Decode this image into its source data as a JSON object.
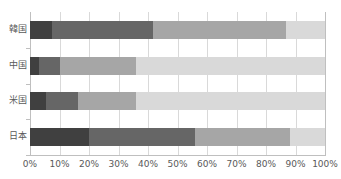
{
  "chart_data": {
    "type": "bar",
    "subtype": "stacked-horizontal-100pct",
    "title": "",
    "xlabel": "",
    "ylabel": "",
    "orientation": "horizontal",
    "stacked": true,
    "normalized_percent": true,
    "grid": true,
    "legend_position": "none",
    "xlim": [
      0,
      100
    ],
    "xticks": [
      0,
      10,
      20,
      30,
      40,
      50,
      60,
      70,
      80,
      90,
      100
    ],
    "xtick_labels": [
      "0%",
      "10%",
      "20%",
      "30%",
      "40%",
      "50%",
      "60%",
      "70%",
      "80%",
      "90%",
      "100%"
    ],
    "categories": [
      "韓国",
      "中国",
      "米国",
      "日本"
    ],
    "series": [
      {
        "name": "segment-1",
        "color": "#404040",
        "values": [
          7.5,
          3.0,
          5.4,
          20.0
        ]
      },
      {
        "name": "segment-2",
        "color": "#666666",
        "values": [
          34.2,
          7.3,
          10.9,
          36.0
        ]
      },
      {
        "name": "segment-3",
        "color": "#a6a6a6",
        "values": [
          45.1,
          25.6,
          19.7,
          32.0
        ]
      },
      {
        "name": "segment-4",
        "color": "#d9d9d9",
        "values": [
          13.2,
          64.1,
          64.0,
          12.0
        ]
      }
    ],
    "cumulative_boundaries": {
      "韓国": [
        7.5,
        41.7,
        86.8,
        100
      ],
      "中国": [
        3.0,
        10.3,
        35.9,
        100
      ],
      "米国": [
        5.4,
        16.3,
        36.0,
        100
      ],
      "日本": [
        20.0,
        56.0,
        88.0,
        100
      ]
    }
  },
  "axis": {
    "x_tick_0": "0%",
    "x_tick_1": "10%",
    "x_tick_2": "20%",
    "x_tick_3": "30%",
    "x_tick_4": "40%",
    "x_tick_5": "50%",
    "x_tick_6": "60%",
    "x_tick_7": "70%",
    "x_tick_8": "80%",
    "x_tick_9": "90%",
    "x_tick_10": "100%"
  },
  "categories_labels": {
    "row_0": "韓国",
    "row_1": "中国",
    "row_2": "米国",
    "row_3": "日本"
  },
  "colors": {
    "segment_1": "#404040",
    "segment_2": "#666666",
    "segment_3": "#a6a6a6",
    "segment_4": "#d9d9d9",
    "gridline": "#d9d9d9",
    "axis": "#bfbfbf",
    "text": "#595959",
    "background": "#ffffff"
  }
}
